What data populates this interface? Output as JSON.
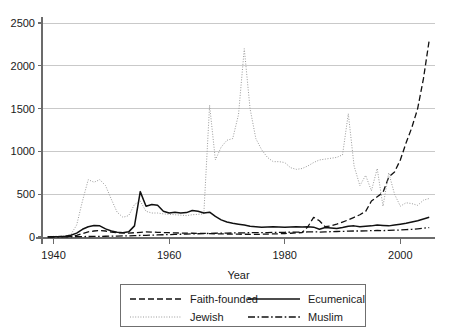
{
  "chart_data": {
    "type": "line",
    "title": "",
    "xlabel": "Year",
    "ylabel": "",
    "xlim": [
      1938,
      2006
    ],
    "ylim": [
      0,
      2500
    ],
    "grid": true,
    "legend_position": "bottom",
    "xticks": [
      1940,
      1960,
      1980,
      2000
    ],
    "yticks": [
      0,
      500,
      1000,
      1500,
      2000,
      2500
    ],
    "xtick_labels": [
      "1940",
      "1960",
      "1980",
      "2000"
    ],
    "ytick_labels": [
      "0",
      "500",
      "1000",
      "1500",
      "2000",
      "2500"
    ],
    "x": [
      1939,
      1940,
      1941,
      1942,
      1943,
      1944,
      1945,
      1946,
      1947,
      1948,
      1949,
      1950,
      1951,
      1952,
      1953,
      1954,
      1955,
      1956,
      1957,
      1958,
      1959,
      1960,
      1961,
      1962,
      1963,
      1964,
      1965,
      1966,
      1967,
      1968,
      1969,
      1970,
      1971,
      1972,
      1973,
      1974,
      1975,
      1976,
      1977,
      1978,
      1979,
      1980,
      1981,
      1982,
      1983,
      1984,
      1985,
      1986,
      1987,
      1988,
      1989,
      1990,
      1991,
      1992,
      1993,
      1994,
      1995,
      1996,
      1997,
      1998,
      1999,
      2000,
      2001,
      2002,
      2003,
      2004,
      2005
    ],
    "series": [
      {
        "name": "Faith-founded",
        "style": "dashed",
        "color": "#111111",
        "values": [
          2,
          3,
          4,
          5,
          8,
          18,
          40,
          60,
          70,
          75,
          70,
          58,
          50,
          48,
          45,
          50,
          55,
          60,
          58,
          55,
          52,
          50,
          48,
          46,
          45,
          44,
          43,
          42,
          40,
          38,
          36,
          35,
          34,
          33,
          32,
          31,
          30,
          32,
          34,
          36,
          38,
          40,
          44,
          48,
          52,
          120,
          230,
          190,
          120,
          130,
          150,
          175,
          200,
          230,
          260,
          300,
          420,
          470,
          520,
          700,
          760,
          900,
          1100,
          1280,
          1500,
          1850,
          2300
        ]
      },
      {
        "name": "Jewish",
        "style": "dotted",
        "color": "#9a9a9a",
        "values": [
          5,
          8,
          10,
          12,
          30,
          140,
          420,
          670,
          640,
          670,
          600,
          440,
          290,
          230,
          250,
          380,
          420,
          300,
          280,
          280,
          270,
          265,
          260,
          255,
          250,
          260,
          265,
          270,
          1540,
          900,
          1050,
          1130,
          1150,
          1430,
          2200,
          1500,
          1150,
          1020,
          930,
          880,
          880,
          870,
          810,
          790,
          800,
          830,
          870,
          900,
          910,
          920,
          930,
          960,
          1440,
          830,
          600,
          720,
          540,
          800,
          360,
          750,
          500,
          360,
          400,
          390,
          370,
          430,
          450
        ]
      },
      {
        "name": "Ecumenical",
        "style": "solid",
        "color": "#111111",
        "values": [
          2,
          4,
          6,
          10,
          20,
          45,
          90,
          120,
          135,
          130,
          95,
          70,
          55,
          50,
          60,
          130,
          530,
          360,
          380,
          370,
          300,
          280,
          290,
          280,
          285,
          310,
          300,
          280,
          290,
          240,
          200,
          175,
          160,
          150,
          140,
          125,
          120,
          115,
          118,
          120,
          118,
          115,
          118,
          120,
          118,
          120,
          115,
          90,
          110,
          105,
          100,
          110,
          125,
          130,
          120,
          125,
          130,
          140,
          135,
          130,
          140,
          150,
          160,
          175,
          190,
          210,
          230
        ]
      },
      {
        "name": "Muslim",
        "style": "dashdot",
        "color": "#111111",
        "values": [
          1,
          1,
          2,
          2,
          3,
          4,
          5,
          6,
          7,
          8,
          9,
          10,
          11,
          12,
          14,
          16,
          18,
          20,
          22,
          24,
          26,
          28,
          30,
          32,
          34,
          36,
          38,
          40,
          42,
          44,
          45,
          46,
          47,
          48,
          49,
          50,
          50,
          51,
          52,
          53,
          54,
          55,
          56,
          57,
          58,
          59,
          60,
          58,
          60,
          62,
          64,
          66,
          68,
          70,
          70,
          72,
          74,
          76,
          75,
          78,
          80,
          82,
          86,
          90,
          96,
          102,
          110
        ]
      }
    ]
  },
  "axis": {
    "x_title": "Year"
  },
  "legend": {
    "entries": [
      {
        "label": "Faith-founded",
        "style": "dashed"
      },
      {
        "label": "Ecumenical",
        "style": "solid"
      },
      {
        "label": "Jewish",
        "style": "dotted"
      },
      {
        "label": "Muslim",
        "style": "dashdot"
      }
    ]
  }
}
